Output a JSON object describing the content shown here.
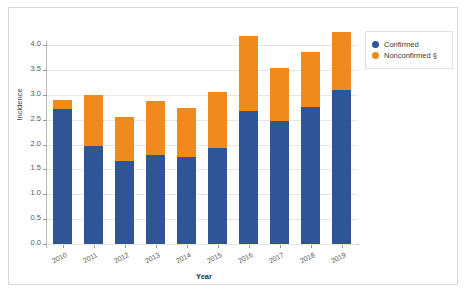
{
  "chart_data": {
    "type": "bar",
    "stacked": true,
    "title": "",
    "xlabel": "Year",
    "ylabel": "Incidence",
    "categories": [
      "2010",
      "2011",
      "2012",
      "2013",
      "2014",
      "2015",
      "2016",
      "2017",
      "2018",
      "2019"
    ],
    "series": [
      {
        "name": "Confirmed",
        "color": "#2f5597",
        "values": [
          2.72,
          1.97,
          1.66,
          1.79,
          1.74,
          1.92,
          2.67,
          2.48,
          2.75,
          3.1
        ]
      },
      {
        "name": "Nonconfirmed §",
        "color": "#f08a1e",
        "values": [
          0.17,
          1.02,
          0.89,
          1.08,
          0.99,
          1.13,
          1.51,
          1.05,
          1.1,
          1.16
        ]
      }
    ],
    "totals": [
      2.89,
      2.99,
      2.55,
      2.87,
      2.73,
      3.05,
      4.18,
      3.53,
      3.85,
      4.26
    ],
    "ylim": [
      0.0,
      4.25
    ],
    "yticks": [
      "0.0",
      "0.5",
      "1.0",
      "1.5",
      "2.0",
      "2.5",
      "3.0",
      "3.5",
      "4.0"
    ],
    "ytick_values": [
      0.0,
      0.5,
      1.0,
      1.5,
      2.0,
      2.5,
      3.0,
      3.5,
      4.0
    ],
    "grid": true,
    "legend_position": "top-right"
  },
  "legend": {
    "items": [
      {
        "label": "Confirmed",
        "color": "#2f5597",
        "icon": "circle-swatch-icon"
      },
      {
        "label": "Nonconfirmed §",
        "color": "#f08a1e",
        "icon": "circle-swatch-icon"
      }
    ]
  },
  "axes": {
    "y_title": "Incidence",
    "x_title": "Year"
  }
}
